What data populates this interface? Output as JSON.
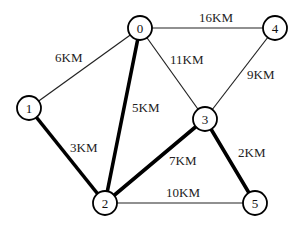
{
  "diagram": {
    "type": "weighted-undirected-graph",
    "node_radius": 12,
    "nodes": [
      {
        "id": "0",
        "label": "0",
        "x": 140,
        "y": 28
      },
      {
        "id": "1",
        "label": "1",
        "x": 29,
        "y": 108
      },
      {
        "id": "2",
        "label": "2",
        "x": 105,
        "y": 203
      },
      {
        "id": "3",
        "label": "3",
        "x": 205,
        "y": 119
      },
      {
        "id": "4",
        "label": "4",
        "x": 275,
        "y": 28
      },
      {
        "id": "5",
        "label": "5",
        "x": 255,
        "y": 203
      }
    ],
    "edges": [
      {
        "from": "0",
        "to": "1",
        "label": "6KM",
        "weight": 6,
        "highlighted": false,
        "lx": 55,
        "ly": 62
      },
      {
        "from": "0",
        "to": "4",
        "label": "16KM",
        "weight": 16,
        "highlighted": false,
        "lx": 199,
        "ly": 22
      },
      {
        "from": "0",
        "to": "3",
        "label": "11KM",
        "weight": 11,
        "highlighted": false,
        "lx": 170,
        "ly": 64
      },
      {
        "from": "0",
        "to": "2",
        "label": "5KM",
        "weight": 5,
        "highlighted": true,
        "lx": 132,
        "ly": 112
      },
      {
        "from": "4",
        "to": "3",
        "label": "9KM",
        "weight": 9,
        "highlighted": false,
        "lx": 247,
        "ly": 79
      },
      {
        "from": "1",
        "to": "2",
        "label": "3KM",
        "weight": 3,
        "highlighted": true,
        "lx": 70,
        "ly": 152
      },
      {
        "from": "2",
        "to": "3",
        "label": "7KM",
        "weight": 7,
        "highlighted": true,
        "lx": 169,
        "ly": 165
      },
      {
        "from": "3",
        "to": "5",
        "label": "2KM",
        "weight": 2,
        "highlighted": true,
        "lx": 238,
        "ly": 157
      },
      {
        "from": "2",
        "to": "5",
        "label": "10KM",
        "weight": 10,
        "highlighted": false,
        "lx": 166,
        "ly": 197
      }
    ]
  }
}
